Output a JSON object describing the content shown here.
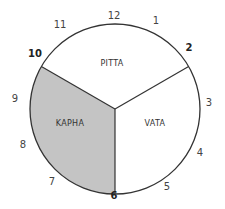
{
  "diagram": {
    "segments": [
      {
        "label": "PITTA",
        "from_hour": 10,
        "to_hour": 2,
        "fill": "#ffffff"
      },
      {
        "label": "VATA",
        "from_hour": 2,
        "to_hour": 6,
        "fill": "#ffffff"
      },
      {
        "label": "KAPHA",
        "from_hour": 6,
        "to_hour": 10,
        "fill": "#c4c4c4"
      }
    ],
    "hours": [
      "12",
      "1",
      "2",
      "3",
      "4",
      "5",
      "6",
      "7",
      "8",
      "9",
      "10",
      "11"
    ],
    "major_hours": [
      "2",
      "6",
      "10"
    ],
    "colors": {
      "stroke": "#333333",
      "kapha_fill": "#c4c4c4"
    }
  }
}
